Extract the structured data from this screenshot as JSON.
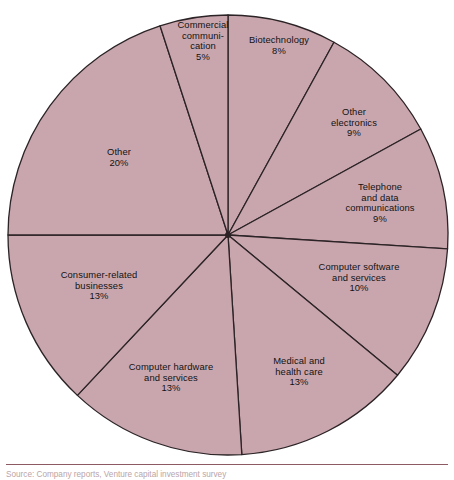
{
  "chart_data": {
    "type": "pie",
    "title": "",
    "subtitle": "",
    "xlabel": "",
    "ylabel": "",
    "legend_position": "none",
    "grid": false,
    "value_unit": "%",
    "start_angle_deg": -90,
    "direction": "clockwise",
    "total": 100,
    "categories": [
      "Biotechnology",
      "Other electronics",
      "Telephone and data communications",
      "Computer software and services",
      "Medical and health care",
      "Computer hardware and services",
      "Consumer-related businesses",
      "Other",
      "Commercial communication"
    ],
    "values": [
      8,
      9,
      9,
      10,
      13,
      13,
      13,
      20,
      5
    ],
    "slices": [
      {
        "label": "Biotechnology",
        "label_lines": "Biotechnology",
        "value": 8,
        "pct_text": "8%",
        "start_deg": -90,
        "sweep_deg": 28.8,
        "label_x": 279,
        "label_y": 46
      },
      {
        "label": "Other electronics",
        "label_lines": "Other\nelectronics",
        "value": 9,
        "pct_text": "9%",
        "start_deg": -61.2,
        "sweep_deg": 32.4,
        "label_x": 354,
        "label_y": 123
      },
      {
        "label": "Telephone and data communications",
        "label_lines": "Telephone\nand data\ncommunications",
        "value": 9,
        "pct_text": "9%",
        "start_deg": -28.8,
        "sweep_deg": 32.4,
        "label_x": 380,
        "label_y": 203
      },
      {
        "label": "Computer software and services",
        "label_lines": "Computer software\nand services",
        "value": 10,
        "pct_text": "10%",
        "start_deg": 3.6,
        "sweep_deg": 36,
        "label_x": 359,
        "label_y": 278
      },
      {
        "label": "Medical and health care",
        "label_lines": "Medical and\nhealth care",
        "value": 13,
        "pct_text": "13%",
        "start_deg": 39.6,
        "sweep_deg": 46.8,
        "label_x": 299,
        "label_y": 372
      },
      {
        "label": "Computer hardware and services",
        "label_lines": "Computer hardware\nand services",
        "value": 13,
        "pct_text": "13%",
        "start_deg": 86.4,
        "sweep_deg": 46.8,
        "label_x": 171,
        "label_y": 378
      },
      {
        "label": "Consumer-related businesses",
        "label_lines": "Consumer-related\nbusinesses",
        "value": 13,
        "pct_text": "13%",
        "start_deg": 133.2,
        "sweep_deg": 46.8,
        "label_x": 99,
        "label_y": 286
      },
      {
        "label": "Other",
        "label_lines": "Other",
        "value": 20,
        "pct_text": "20%",
        "start_deg": 180,
        "sweep_deg": 72,
        "label_x": 119,
        "label_y": 158
      },
      {
        "label": "Commercial communication",
        "label_lines": "Commercial\ncommuni-\ncation",
        "value": 5,
        "pct_text": "5%",
        "start_deg": 252,
        "sweep_deg": 18,
        "label_x": 203,
        "label_y": 41
      }
    ],
    "geometry": {
      "center_x": 228,
      "center_y": 235,
      "radius": 220
    },
    "colors": {
      "slice_fill": "#c9a6ae",
      "slice_stroke": "#2b2326",
      "label_text": "#121212",
      "rule": "#8d5a63",
      "background": "#ffffff"
    }
  },
  "footer": {
    "source_note": "Source: Company reports, Venture capital investment survey"
  }
}
